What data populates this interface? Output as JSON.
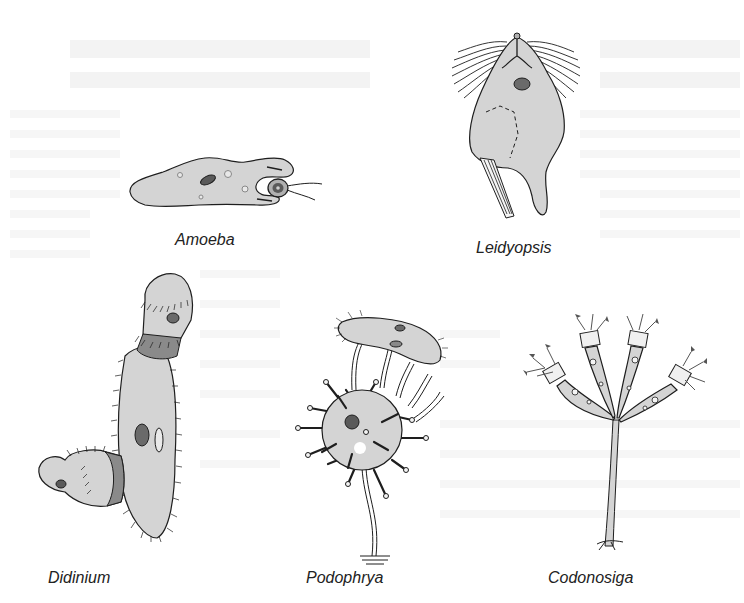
{
  "figure": {
    "type": "scientific-illustration",
    "background_color": "#ffffff",
    "ink_color": "#1e1e1e",
    "fill_color": "#d4d4d4",
    "organisms": [
      {
        "id": "amoeba",
        "label": "Amoeba"
      },
      {
        "id": "leidyopsis",
        "label": "Leidyopsis"
      },
      {
        "id": "didinium",
        "label": "Didinium"
      },
      {
        "id": "podophrya",
        "label": "Podophrya"
      },
      {
        "id": "codonosiga",
        "label": "Codonosiga"
      }
    ]
  }
}
